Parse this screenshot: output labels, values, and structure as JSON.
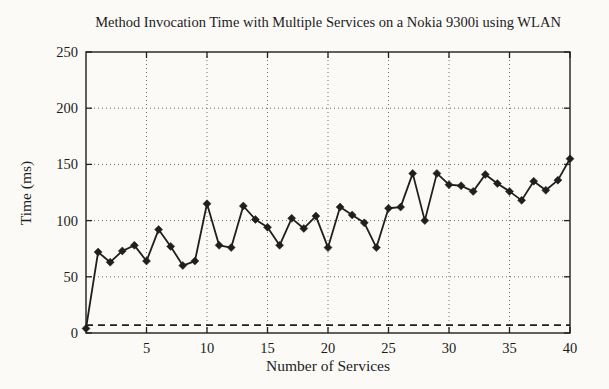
{
  "figure": {
    "kind": "scanned-paper-plot",
    "paper_color": "#fbfaf7",
    "ink_color": "#1f1f1f",
    "grid_color": "#6e6e6e"
  },
  "chart_data": {
    "type": "line",
    "title": "Method Invocation Time with Multiple Services on a Nokia 9300i using WLAN",
    "xlabel": "Number of Services",
    "ylabel": "Time (ms)",
    "xlim": [
      0,
      40
    ],
    "ylim": [
      0,
      250
    ],
    "xticks": [
      5,
      10,
      15,
      20,
      25,
      30,
      35,
      40
    ],
    "yticks": [
      0,
      50,
      100,
      150,
      200,
      250
    ],
    "grid": true,
    "legend": "none",
    "series": [
      {
        "name": "method-invocation-time",
        "style": "solid",
        "marker": "diamond",
        "x": [
          0,
          1,
          2,
          3,
          4,
          5,
          6,
          7,
          8,
          9,
          10,
          11,
          12,
          13,
          14,
          15,
          16,
          17,
          18,
          19,
          20,
          21,
          22,
          23,
          24,
          25,
          26,
          27,
          28,
          29,
          30,
          31,
          32,
          33,
          34,
          35,
          36,
          37,
          38,
          39,
          40
        ],
        "y": [
          4,
          72,
          63,
          73,
          78,
          64,
          92,
          77,
          60,
          64,
          115,
          78,
          76,
          113,
          101,
          94,
          78,
          102,
          93,
          104,
          76,
          112,
          105,
          98,
          76,
          111,
          112,
          142,
          100,
          142,
          132,
          131,
          126,
          141,
          133,
          126,
          118,
          135,
          127,
          136,
          155
        ]
      },
      {
        "name": "reference-baseline",
        "style": "dashed",
        "marker": "none",
        "x": [
          0,
          40
        ],
        "y": [
          7,
          7
        ]
      }
    ]
  }
}
